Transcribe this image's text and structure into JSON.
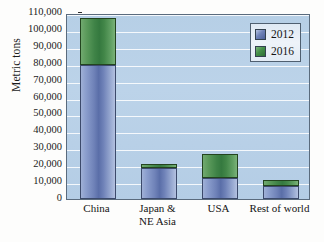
{
  "chart_data": {
    "type": "bar",
    "subtype": "stacked-bar",
    "title": "",
    "xlabel": "",
    "ylabel": "Metric tons",
    "ylim": [
      0,
      110000
    ],
    "ytick_step": 10000,
    "grid": true,
    "legend_position": "top-right",
    "categories": [
      "China",
      "Japan & NE Asia",
      "USA",
      "Rest of world"
    ],
    "category_labels": [
      {
        "line1": "China",
        "line2": ""
      },
      {
        "line1": "Japan &",
        "line2": "NE Asia"
      },
      {
        "line1": "USA",
        "line2": ""
      },
      {
        "line1": "Rest of world",
        "line2": ""
      }
    ],
    "ytick_labels": [
      "110,000",
      "100,000",
      "90,000",
      "80,000",
      "70,000",
      "60,000",
      "50,000",
      "40,000",
      "30,000",
      "20,000",
      "10,000",
      "0"
    ],
    "ytick_values": [
      110000,
      100000,
      90000,
      80000,
      70000,
      60000,
      50000,
      40000,
      30000,
      20000,
      10000,
      0
    ],
    "series": [
      {
        "name": "2012",
        "color": "#5a6ea8",
        "values": [
          79500,
          18500,
          12500,
          7500
        ]
      },
      {
        "name": "2016",
        "color": "#3f8347",
        "values": [
          27500,
          2300,
          14000,
          4000
        ]
      }
    ],
    "totals": [
      107000,
      20800,
      26500,
      11500
    ]
  },
  "legend": {
    "entries": [
      {
        "label": "2012",
        "swatch": "swatch-2012-icon"
      },
      {
        "label": "2016",
        "swatch": "swatch-2016-icon"
      }
    ]
  }
}
